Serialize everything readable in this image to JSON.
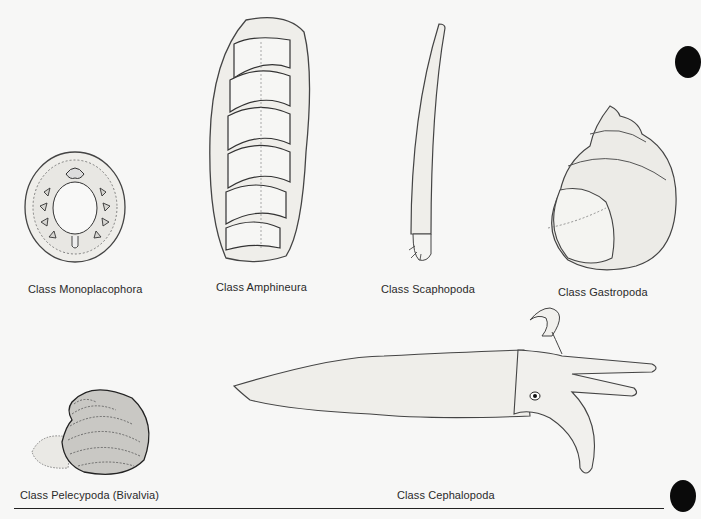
{
  "figure": {
    "colors": {
      "background": "#f7f7f6",
      "ink": "#333333",
      "fill": "#ecebe8",
      "hole": "#0a0a0a"
    },
    "classes": [
      {
        "id": "monoplacophora",
        "label": "Class Monoplacophora",
        "icon": "monoplacophora-shell-drawing"
      },
      {
        "id": "amphineura",
        "label": "Class Amphineura",
        "icon": "chiton-drawing"
      },
      {
        "id": "scaphopoda",
        "label": "Class Scaphopoda",
        "icon": "tusk-shell-drawing"
      },
      {
        "id": "gastropoda",
        "label": "Class Gastropoda",
        "icon": "snail-shell-drawing"
      },
      {
        "id": "pelecypoda",
        "label": "Class Pelecypoda (Bivalvia)",
        "icon": "clam-drawing"
      },
      {
        "id": "cephalopoda",
        "label": "Class Cephalopoda",
        "icon": "squid-drawing"
      }
    ]
  }
}
